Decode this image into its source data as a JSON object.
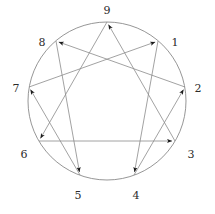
{
  "figure": {
    "name": "enneagram",
    "background_color": "#ffffff",
    "line_color": "#8a8a8a",
    "arrow_color": "#1a1a1a",
    "label_color": "#2b2b2b",
    "circle": {
      "cx": 107,
      "cy": 101,
      "r": 79,
      "stroke_width": 0.9
    }
  },
  "vertices": [
    {
      "id": "9",
      "label": "9",
      "angle_deg": 90,
      "px": 107,
      "py": 22,
      "label_x": 107,
      "label_y": 11
    },
    {
      "id": "1",
      "label": "1",
      "angle_deg": 50,
      "px": 158,
      "py": 41,
      "label_x": 175,
      "label_y": 43
    },
    {
      "id": "2",
      "label": "2",
      "angle_deg": 10,
      "px": 185,
      "py": 87,
      "label_x": 198,
      "label_y": 89
    },
    {
      "id": "3",
      "label": "3",
      "angle_deg": -30,
      "px": 175,
      "py": 141,
      "label_x": 191,
      "label_y": 155
    },
    {
      "id": "4",
      "label": "4",
      "angle_deg": -70,
      "px": 134,
      "py": 175,
      "label_x": 136,
      "label_y": 196
    },
    {
      "id": "5",
      "label": "5",
      "angle_deg": -110,
      "px": 80,
      "py": 175,
      "label_x": 78,
      "label_y": 196
    },
    {
      "id": "6",
      "label": "6",
      "angle_deg": -150,
      "px": 39,
      "py": 141,
      "label_x": 24,
      "label_y": 155
    },
    {
      "id": "7",
      "label": "7",
      "angle_deg": 170,
      "px": 29,
      "py": 87,
      "label_x": 16,
      "label_y": 89
    },
    {
      "id": "8",
      "label": "8",
      "angle_deg": 130,
      "px": 56,
      "py": 41,
      "label_x": 42,
      "label_y": 43
    }
  ],
  "triangle_path": {
    "name": "inner-triangle",
    "sequence": [
      "9",
      "6",
      "3",
      "9"
    ],
    "edges": [
      {
        "from": "9",
        "to": "6",
        "arrow": true
      },
      {
        "from": "6",
        "to": "3",
        "arrow": true
      },
      {
        "from": "3",
        "to": "9",
        "arrow": true
      }
    ]
  },
  "hexad_path": {
    "name": "inner-hexad",
    "sequence": [
      "1",
      "4",
      "2",
      "8",
      "5",
      "7",
      "1"
    ],
    "edges": [
      {
        "from": "1",
        "to": "4",
        "arrow": true
      },
      {
        "from": "4",
        "to": "2",
        "arrow": true
      },
      {
        "from": "2",
        "to": "8",
        "arrow": true
      },
      {
        "from": "8",
        "to": "5",
        "arrow": true
      },
      {
        "from": "5",
        "to": "7",
        "arrow": true
      },
      {
        "from": "7",
        "to": "1",
        "arrow": true
      }
    ]
  }
}
